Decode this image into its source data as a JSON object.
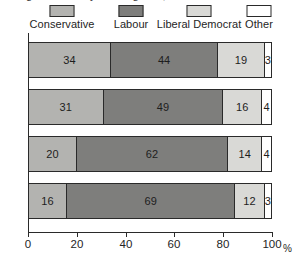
{
  "title_remnant": "Voting intention by social grade, Great Britain",
  "legend": {
    "items": [
      {
        "label": "Conservative",
        "color": "#b3b3b0",
        "swatch": "legend-swatch-conservative"
      },
      {
        "label": "Labour",
        "color": "#7e7e7c",
        "swatch": "legend-swatch-labour"
      },
      {
        "label": "Liberal Democrat",
        "color": "#d9d9d6",
        "swatch": "legend-swatch-liberal-democrat"
      },
      {
        "label": "Other",
        "color": "#ffffff",
        "swatch": "legend-swatch-other"
      }
    ]
  },
  "axis": {
    "x_unit": "%",
    "x_ticks": [
      "0",
      "20",
      "40",
      "60",
      "80",
      "100"
    ],
    "y_categories": [
      "AB",
      "C1",
      "C2",
      "DE"
    ]
  },
  "chart_data": {
    "type": "bar",
    "orientation": "horizontal",
    "stacked": true,
    "stack_total": 100,
    "title": "Voting intention by social grade, Great Britain",
    "xlabel": "%",
    "ylabel": "",
    "xlim": [
      0,
      100
    ],
    "grid": false,
    "legend_position": "top",
    "categories": [
      "AB",
      "C1",
      "C2",
      "DE"
    ],
    "series": [
      {
        "name": "Conservative",
        "color": "#b3b3b0",
        "values": [
          34,
          31,
          20,
          16
        ]
      },
      {
        "name": "Labour",
        "color": "#7e7e7c",
        "values": [
          44,
          49,
          62,
          69
        ]
      },
      {
        "name": "Liberal Democrat",
        "color": "#d9d9d6",
        "values": [
          19,
          16,
          14,
          12
        ]
      },
      {
        "name": "Other",
        "color": "#ffffff",
        "values": [
          3,
          4,
          4,
          3
        ]
      }
    ],
    "rows": [
      {
        "category": "AB",
        "values": [
          34,
          44,
          19,
          3
        ]
      },
      {
        "category": "C1",
        "values": [
          31,
          49,
          16,
          4
        ]
      },
      {
        "category": "C2",
        "values": [
          20,
          62,
          14,
          4
        ]
      },
      {
        "category": "DE",
        "values": [
          16,
          69,
          12,
          3
        ]
      }
    ]
  }
}
